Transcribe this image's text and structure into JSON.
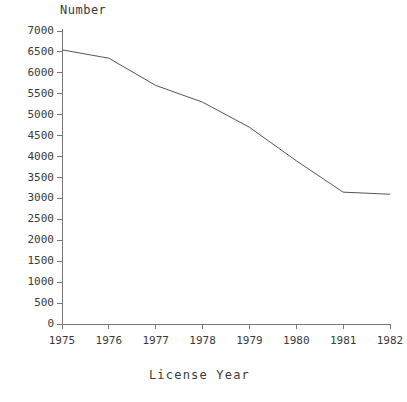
{
  "chart_data": {
    "type": "line",
    "title": "",
    "xlabel": "License Year",
    "ylabel": "Number",
    "x": [
      1975,
      1976,
      1977,
      1978,
      1979,
      1980,
      1981,
      1982
    ],
    "values": [
      6550,
      6350,
      5700,
      5300,
      4700,
      3900,
      3150,
      3100
    ],
    "series": [
      {
        "name": "Number",
        "values": [
          6550,
          6350,
          5700,
          5300,
          4700,
          3900,
          3150,
          3100
        ]
      }
    ],
    "xlim": [
      1975,
      1982
    ],
    "ylim": [
      0,
      7000
    ],
    "x_tick_labels": [
      "1975",
      "1976",
      "1977",
      "1978",
      "1979",
      "1980",
      "1981",
      "1982"
    ],
    "y_tick_labels": [
      "0",
      "500",
      "1000",
      "1500",
      "2000",
      "2500",
      "3000",
      "3500",
      "4000",
      "4500",
      "5000",
      "5500",
      "6000",
      "6500",
      "7000"
    ],
    "y_ticks": [
      0,
      500,
      1000,
      1500,
      2000,
      2500,
      3000,
      3500,
      4000,
      4500,
      5000,
      5500,
      6000,
      6500,
      7000
    ],
    "grid": false,
    "legend": null,
    "line_color": "#555555",
    "axis_color": "#777777"
  }
}
